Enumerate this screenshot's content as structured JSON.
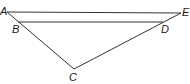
{
  "diagram": {
    "type": "geometry",
    "line_color": "#333333",
    "label_color": "#1a1a1a",
    "points": {
      "A": {
        "label": "A",
        "x": 7,
        "y": 12
      },
      "B": {
        "label": "B",
        "x": 18,
        "y": 22
      },
      "C": {
        "label": "C",
        "x": 74,
        "y": 69
      },
      "D": {
        "label": "D",
        "x": 163,
        "y": 22
      },
      "E": {
        "label": "E",
        "x": 181,
        "y": 13
      }
    },
    "segments": [
      {
        "name": "AE",
        "from": "A",
        "to": "E"
      },
      {
        "name": "BD",
        "from": "B",
        "to": "D"
      },
      {
        "name": "AC",
        "from": "A",
        "to": "C"
      },
      {
        "name": "CE",
        "from": "C",
        "to": "E"
      }
    ]
  }
}
